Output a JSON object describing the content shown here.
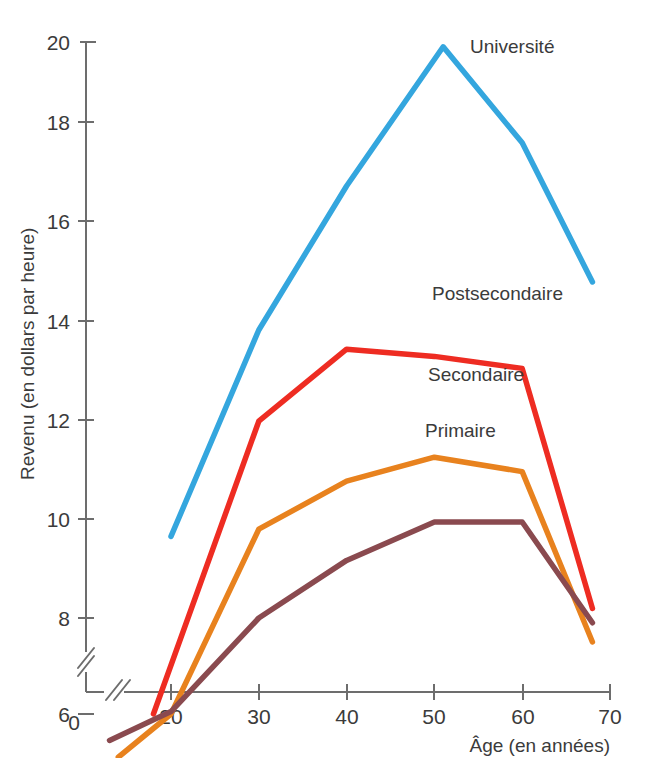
{
  "chart_data": {
    "type": "line",
    "title": "",
    "xlabel": "Âge (en années)",
    "ylabel": "Revenu (en dollars par heure)",
    "xlim": [
      10,
      72
    ],
    "ylim": [
      4.6,
      20.4
    ],
    "x_ticks": [
      "0",
      "20",
      "30",
      "40",
      "50",
      "60",
      "70"
    ],
    "y_ticks": [
      "20",
      "18",
      "16",
      "14",
      "12",
      "10",
      "8",
      "6"
    ],
    "grid": false,
    "legend_position": "inline-labels",
    "axis_break_x": true,
    "axis_break_y": true,
    "series": [
      {
        "name": "Université",
        "color": "#34A6DE",
        "label": "Université",
        "x": [
          20,
          30,
          40,
          51,
          60,
          68
        ],
        "values": [
          9.7,
          14.0,
          17.0,
          19.9,
          17.9,
          15.0
        ]
      },
      {
        "name": "Postsecondaire",
        "color": "#EE2C22",
        "label": "Postsecondaire",
        "x": [
          18,
          30,
          40,
          50,
          60,
          68
        ],
        "values": [
          6.0,
          12.1,
          13.6,
          13.45,
          13.2,
          8.2
        ]
      },
      {
        "name": "Secondaire",
        "color": "#E8821E",
        "label": "Secondaire",
        "x": [
          14,
          20,
          30,
          40,
          50,
          60,
          68
        ],
        "values": [
          5.1,
          6.0,
          9.85,
          10.85,
          11.35,
          11.05,
          7.5
        ]
      },
      {
        "name": "Primaire",
        "color": "#8A4A4F",
        "label": "Primaire",
        "x": [
          13,
          20,
          30,
          40,
          50,
          60,
          68
        ],
        "values": [
          5.45,
          6.05,
          8.0,
          9.2,
          10.0,
          10.0,
          7.9
        ]
      }
    ]
  },
  "axis": {
    "y_label": "Revenu (en dollars par heure)",
    "x_label": "Âge (en années)",
    "origin_label": "0",
    "y_ticks": [
      "20",
      "18",
      "16",
      "14",
      "12",
      "10",
      "8",
      "6"
    ],
    "x_ticks": [
      "20",
      "30",
      "40",
      "50",
      "60",
      "70"
    ]
  },
  "series_labels": {
    "universite": "Université",
    "postsecondaire": "Postsecondaire",
    "secondaire": "Secondaire",
    "primaire": "Primaire"
  },
  "colors": {
    "universite": "#34A6DE",
    "postsecondaire": "#EE2C22",
    "secondaire": "#E8821E",
    "primaire": "#8A4A4F",
    "axis": "#6d6d6d",
    "text": "#3b3b3b"
  }
}
